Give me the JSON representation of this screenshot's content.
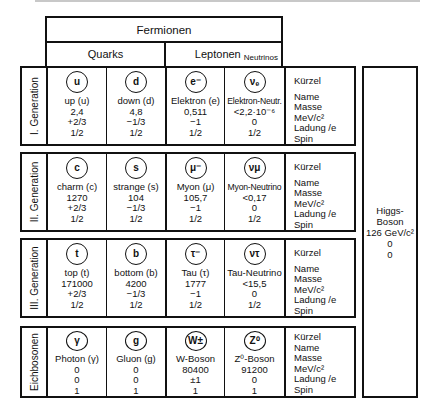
{
  "title": "Fermionen",
  "groups": {
    "quarks": "Quarks",
    "leptons": "Leptonen",
    "neutrinos": "Neutrinos"
  },
  "legend": [
    "Kürzel",
    "Name",
    "Masse MeV/c²",
    "Ladung /e",
    "Spin"
  ],
  "generations": [
    {
      "label": "I. Generation",
      "particles": [
        {
          "symbol": "u",
          "name": "up (u)",
          "mass": "2,4",
          "charge": "+2/3",
          "spin": "1/2"
        },
        {
          "symbol": "d",
          "name": "down (d)",
          "mass": "4,8",
          "charge": "−1/3",
          "spin": "1/2"
        },
        {
          "symbol": "e⁻",
          "name": "Elektron (e)",
          "mass": "0,511",
          "charge": "−1",
          "spin": "1/2"
        },
        {
          "symbol": "νₑ",
          "name": "Elektron-Neutr.",
          "mass": "<2,2·10⁻⁶",
          "charge": "0",
          "spin": "1/2"
        }
      ]
    },
    {
      "label": "II. Generation",
      "particles": [
        {
          "symbol": "c",
          "name": "charm (c)",
          "mass": "1270",
          "charge": "+2/3",
          "spin": "1/2"
        },
        {
          "symbol": "s",
          "name": "strange (s)",
          "mass": "104",
          "charge": "−1/3",
          "spin": "1/2"
        },
        {
          "symbol": "μ⁻",
          "name": "Myon (μ)",
          "mass": "105,7",
          "charge": "−1",
          "spin": "1/2"
        },
        {
          "symbol": "νμ",
          "name": "Myon-Neutrino",
          "mass": "<0,17",
          "charge": "0",
          "spin": "1/2"
        }
      ]
    },
    {
      "label": "III. Generation",
      "particles": [
        {
          "symbol": "t",
          "name": "top (t)",
          "mass": "171000",
          "charge": "+2/3",
          "spin": "1/2"
        },
        {
          "symbol": "b",
          "name": "bottom (b)",
          "mass": "4200",
          "charge": "−1/3",
          "spin": "1/2"
        },
        {
          "symbol": "τ⁻",
          "name": "Tau (τ)",
          "mass": "1777",
          "charge": "−1",
          "spin": "1/2"
        },
        {
          "symbol": "ντ",
          "name": "Tau-Neutrino",
          "mass": "<15,5",
          "charge": "0",
          "spin": "1/2"
        }
      ]
    },
    {
      "label": "Eichbosonen",
      "particles": [
        {
          "symbol": "γ",
          "name": "Photon (γ)",
          "mass": "0",
          "charge": "0",
          "spin": "1"
        },
        {
          "symbol": "g",
          "name": "Gluon (g)",
          "mass": "0",
          "charge": "0",
          "spin": "1"
        },
        {
          "symbol": "W±",
          "name": "W-Boson",
          "mass": "80400",
          "charge": "±1",
          "spin": "1"
        },
        {
          "symbol": "Z⁰",
          "name": "Z⁰-Boson",
          "mass": "91200",
          "charge": "0",
          "spin": "1"
        }
      ]
    }
  ],
  "higgs": {
    "name": "Higgs-Boson",
    "mass": "126 GeV/c²",
    "charge": "0",
    "spin": "0"
  }
}
